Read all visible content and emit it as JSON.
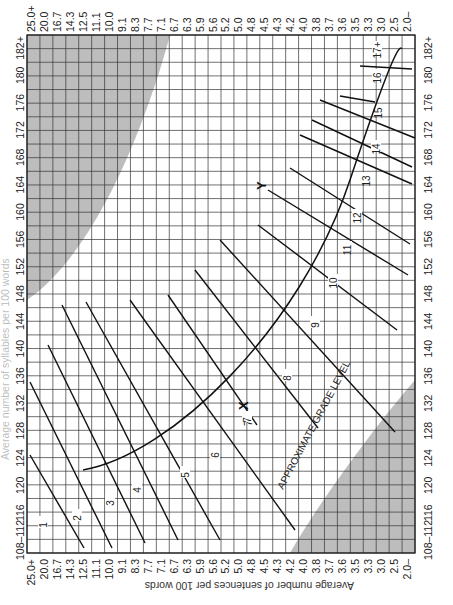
{
  "chart_data": {
    "type": "line",
    "xlabel": "Average number of sentences per 100 words",
    "ylabel": "Average number of syllables per 100 words",
    "sentence_ticks": [
      "25.0+",
      "20.0",
      "16.7",
      "14.3",
      "12.5",
      "11.1",
      "10.0",
      "9.1",
      "8.3",
      "7.7",
      "7.1",
      "6.7",
      "6.3",
      "5.9",
      "5.6",
      "5.2",
      "5.0",
      "4.8",
      "4.5",
      "4.3",
      "4.2",
      "4.0",
      "3.8",
      "3.7",
      "3.6",
      "3.5",
      "3.3",
      "3.0",
      "2.5",
      "2.0–"
    ],
    "syllable_ticks": [
      "108–112",
      "116",
      "120",
      "124",
      "128",
      "132",
      "136",
      "140",
      "144",
      "148",
      "152",
      "156",
      "160",
      "164",
      "168",
      "172",
      "176",
      "180",
      "182+"
    ],
    "grid": true,
    "curve_label": "APPROXIMATE GRADE LEVEL",
    "markers": [
      {
        "label": "X"
      },
      {
        "label": "Y"
      }
    ],
    "grade_levels": [
      {
        "grade": "1",
        "x1": 30,
        "y1": 455,
        "x2": 84,
        "y2": 548,
        "lx": 43,
        "ly": 525
      },
      {
        "grade": "2",
        "x1": 30,
        "y1": 382,
        "x2": 112,
        "y2": 548,
        "lx": 77,
        "ly": 518
      },
      {
        "grade": "3",
        "x1": 48,
        "y1": 345,
        "x2": 145,
        "y2": 543,
        "lx": 110,
        "ly": 503
      },
      {
        "grade": "4",
        "x1": 62,
        "y1": 305,
        "x2": 178,
        "y2": 540,
        "lx": 137,
        "ly": 490
      },
      {
        "grade": "5",
        "x1": 86,
        "y1": 302,
        "x2": 220,
        "y2": 540,
        "lx": 185,
        "ly": 475
      },
      {
        "grade": "6",
        "x1": 130,
        "y1": 300,
        "x2": 295,
        "y2": 530,
        "lx": 215,
        "ly": 455
      },
      {
        "grade": "7",
        "x1": 168,
        "y1": 295,
        "x2": 257,
        "y2": 425,
        "lx": 247,
        "ly": 420
      },
      {
        "grade": "8",
        "x1": 195,
        "y1": 270,
        "x2": 318,
        "y2": 428,
        "lx": 287,
        "ly": 378
      },
      {
        "grade": "9",
        "x1": 220,
        "y1": 240,
        "x2": 395,
        "y2": 432,
        "lx": 315,
        "ly": 325
      },
      {
        "grade": "10",
        "x1": 258,
        "y1": 225,
        "x2": 397,
        "y2": 330,
        "lx": 333,
        "ly": 283
      },
      {
        "grade": "11",
        "x1": 268,
        "y1": 190,
        "x2": 408,
        "y2": 275,
        "lx": 347,
        "ly": 250
      },
      {
        "grade": "12",
        "x1": 290,
        "y1": 168,
        "x2": 410,
        "y2": 244,
        "lx": 357,
        "ly": 218
      },
      {
        "grade": "13",
        "x1": 300,
        "y1": 135,
        "x2": 412,
        "y2": 184,
        "lx": 366,
        "ly": 181
      },
      {
        "grade": "14",
        "x1": 312,
        "y1": 120,
        "x2": 412,
        "y2": 167,
        "lx": 376,
        "ly": 149
      },
      {
        "grade": "15",
        "x1": 320,
        "y1": 100,
        "x2": 415,
        "y2": 138,
        "lx": 378,
        "ly": 113
      },
      {
        "grade": "16",
        "x1": 340,
        "y1": 96,
        "x2": 375,
        "y2": 102,
        "lx": 377,
        "ly": 78
      },
      {
        "grade": "17+",
        "x1": 360,
        "y1": 66,
        "x2": 412,
        "y2": 69,
        "lx": 377,
        "ly": 50
      }
    ]
  },
  "axes": {
    "left_title": "Average number of syllables per 100 words",
    "bottom_title": "Average number of sentences per 100 words",
    "marker_x": "X",
    "marker_x_label": "7",
    "marker_y": "Y"
  }
}
